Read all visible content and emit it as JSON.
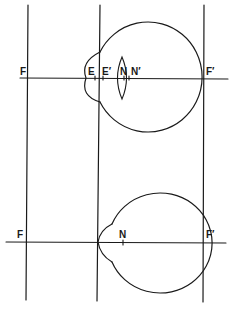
{
  "diagram": {
    "type": "optics-eye-schematic",
    "top": {
      "labels": {
        "f": "F",
        "e": "E",
        "e_prime": "E′",
        "n": "N",
        "n_prime": "N′",
        "f_prime": "F′"
      }
    },
    "bottom": {
      "labels": {
        "f": "F",
        "n": "N",
        "f_prime": "F′"
      }
    },
    "colors": {
      "ink": "#1a1a1a",
      "background": "#ffffff"
    }
  }
}
